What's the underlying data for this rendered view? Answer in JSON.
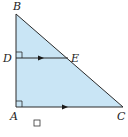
{
  "diagram": {
    "type": "geometry-triangle",
    "points": {
      "B": {
        "label": "B",
        "x": 16,
        "y": 14
      },
      "D": {
        "label": "D",
        "x": 16,
        "y": 58
      },
      "E": {
        "label": "E",
        "x": 68,
        "y": 58
      },
      "A": {
        "label": "A",
        "x": 16,
        "y": 107
      },
      "C": {
        "label": "C",
        "x": 123,
        "y": 107
      }
    },
    "fill_color": "#c9e5f5",
    "stroke_color": "#2a2a2a",
    "segments": [
      "AB",
      "BC",
      "AC",
      "DE"
    ],
    "parallel_marks": [
      "DE",
      "AC"
    ],
    "right_angles": [
      "D",
      "A"
    ],
    "checkbox": {
      "checked": false
    }
  }
}
